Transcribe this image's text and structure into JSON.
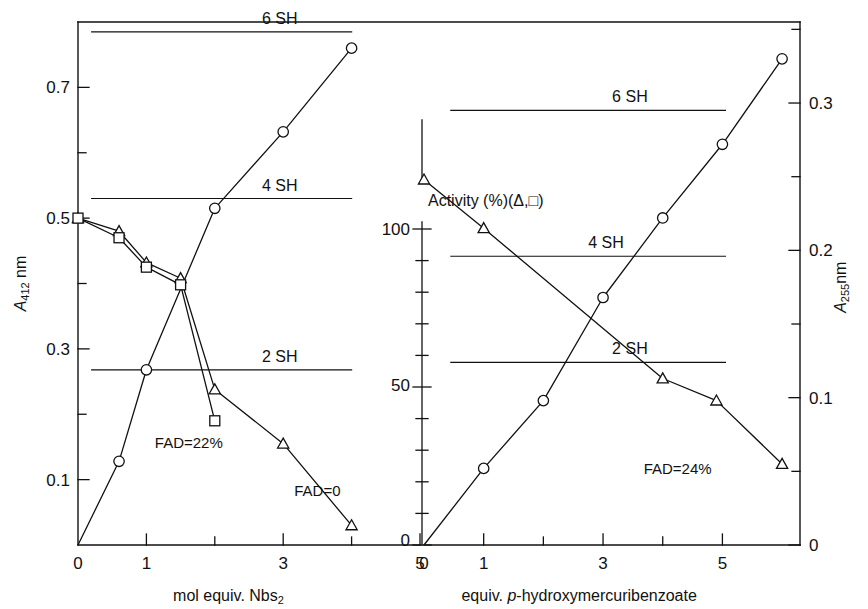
{
  "figure": {
    "width": 868,
    "height": 609,
    "background": "#ffffff",
    "ink": "#111111"
  },
  "center_axis": {
    "label": "Activity (%)(Δ,□)",
    "ticks_major": [
      "0",
      "50",
      "100"
    ],
    "range": [
      0,
      100
    ],
    "tick_step_minor": 10
  },
  "chart_data": [
    {
      "type": "line",
      "panel": "left",
      "title": "",
      "xlabel": "mol equiv. Nbs2",
      "xlabel_parts": {
        "pre": "mol equiv. Nbs",
        "sub": "2"
      },
      "ylabel": "A412 nm",
      "ylabel_parts": {
        "pre": "A",
        "sub": "412",
        "post": " nm"
      },
      "xlim": [
        0,
        5
      ],
      "ylim": [
        0,
        0.8
      ],
      "xticks": [
        0,
        1,
        2,
        3,
        4,
        5
      ],
      "xtick_labels": [
        "0",
        "1",
        "",
        "3",
        "",
        "5"
      ],
      "yticks": [
        0.1,
        0.2,
        0.3,
        0.4,
        0.5,
        0.6,
        0.7
      ],
      "ytick_labels": [
        "0.1",
        "",
        "0.3",
        "",
        "0.5",
        "",
        "0.7"
      ],
      "y2lim": [
        0,
        100
      ],
      "grid": false,
      "legend": "none",
      "reference_lines": [
        {
          "label": "6 SH",
          "y": 0.785,
          "x_start": 0.2,
          "x_end": 4.0,
          "label_x": 2.95
        },
        {
          "label": "4 SH",
          "y": 0.53,
          "x_start": 0.2,
          "x_end": 4.0,
          "label_x": 2.95
        },
        {
          "label": "2 SH",
          "y": 0.268,
          "x_start": 0.2,
          "x_end": 4.0,
          "label_x": 2.95
        }
      ],
      "series": [
        {
          "name": "A412 (circle)",
          "marker": "circle",
          "axis": "left",
          "x": [
            0,
            0.6,
            1.0,
            2.0,
            3.0,
            4.0
          ],
          "y": [
            0.0,
            0.128,
            0.268,
            0.515,
            0.632,
            0.76
          ]
        },
        {
          "name": "Activity triangle",
          "marker": "triangle",
          "axis": "left",
          "x": [
            0,
            0.6,
            1.0,
            1.5,
            2.0,
            3.0,
            4.0
          ],
          "y": [
            0.5,
            0.48,
            0.432,
            0.408,
            0.238,
            0.155,
            0.03
          ]
        },
        {
          "name": "Activity square",
          "marker": "square",
          "axis": "left",
          "x": [
            0,
            0.6,
            1.0,
            1.5,
            2.0
          ],
          "y": [
            0.5,
            0.47,
            0.425,
            0.398,
            0.19
          ]
        }
      ],
      "annotations": [
        {
          "text": "FAD=22%",
          "x": 1.62,
          "y": 0.148
        },
        {
          "text": "FAD=0",
          "x": 3.5,
          "y": 0.075
        }
      ]
    },
    {
      "type": "line",
      "panel": "right",
      "title": "",
      "xlabel": "equiv. p-hydroxymercuribenzoate",
      "xlabel_parts": {
        "pre": "equiv. ",
        "ital": "p",
        "post": "-hydroxymercuribenzoate"
      },
      "ylabel": "A255nm",
      "ylabel_parts": {
        "pre": "A",
        "sub": "255",
        "post": "nm"
      },
      "xlim": [
        0,
        6.3
      ],
      "ylim": [
        0,
        0.355
      ],
      "xticks": [
        0,
        1,
        2,
        3,
        4,
        5
      ],
      "xtick_labels": [
        "0",
        "1",
        "",
        "3",
        "",
        "5"
      ],
      "yticks": [
        0,
        0.05,
        0.1,
        0.15,
        0.2,
        0.25,
        0.3,
        0.35
      ],
      "ytick_labels": [
        "0",
        "",
        "0.1",
        "",
        "0.2",
        "",
        "0.3",
        ""
      ],
      "y2lim": [
        0,
        100
      ],
      "grid": false,
      "legend": "none",
      "reference_lines": [
        {
          "label": "6 SH",
          "y": 0.295,
          "x_start": 0.45,
          "x_end": 5.05,
          "label_x": 3.45
        },
        {
          "label": "4 SH",
          "y": 0.196,
          "x_start": 0.45,
          "x_end": 5.05,
          "label_x": 3.05
        },
        {
          "label": "2 SH",
          "y": 0.124,
          "x_start": 0.45,
          "x_end": 5.05,
          "label_x": 3.45
        }
      ],
      "series": [
        {
          "name": "A255 (circle)",
          "marker": "circle",
          "axis": "right",
          "x": [
            0,
            1.0,
            2.0,
            3.0,
            4.0,
            5.0,
            6.0
          ],
          "y": [
            0.0,
            0.052,
            0.098,
            0.168,
            0.222,
            0.272,
            0.33
          ]
        },
        {
          "name": "Activity triangle",
          "marker": "triangle",
          "axis": "right",
          "x": [
            0,
            1.0,
            4.0,
            4.9,
            6.0
          ],
          "y": [
            0.248,
            0.215,
            0.113,
            0.098,
            0.055
          ]
        }
      ],
      "annotations": [
        {
          "text": "FAD=24%",
          "x": 4.25,
          "y": 0.048
        }
      ]
    }
  ]
}
